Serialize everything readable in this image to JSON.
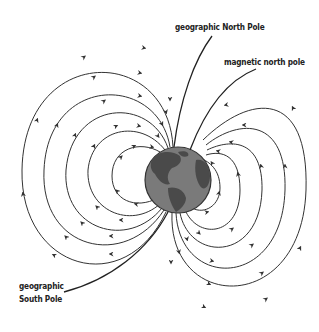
{
  "labels": {
    "geographic_north": "geographic North Pole",
    "magnetic_north": "magnetic north pole",
    "geographic_south_line1": "geographic",
    "geographic_south_line2": "South Pole"
  },
  "globe": {
    "cx": 178,
    "cy": 180,
    "r": 33,
    "ocean_color": "#7a7a7a",
    "land_color": "#4a4a4a",
    "outline_color": "#333333"
  },
  "field_line_color": "#333333",
  "pointer_line_color": "#222222"
}
